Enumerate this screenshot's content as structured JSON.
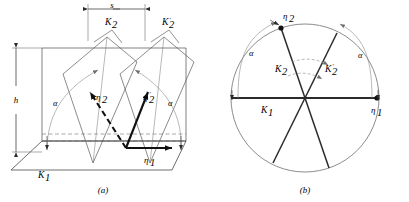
{
  "figure": {
    "type": "geometric-diagram",
    "background_color": "#ffffff",
    "line_color": "#2b2b2b",
    "thin_line_color": "#6e6e6e",
    "bold_line_color": "#111111"
  },
  "panel_a": {
    "caption": "(a)",
    "dimension_labels": {
      "shear_distance": "s",
      "height": "h"
    },
    "plane_labels": [
      {
        "id": "k2",
        "text": "K",
        "subscript": "2",
        "prime": ""
      },
      {
        "id": "k2prime",
        "text": "K",
        "subscript": "2",
        "prime": "′"
      },
      {
        "id": "k1",
        "text": "K",
        "subscript": "1",
        "prime": ""
      }
    ],
    "vector_labels": [
      {
        "id": "eta2",
        "text": "η",
        "subscript": "2",
        "prime": ""
      },
      {
        "id": "eta2prime",
        "text": "η",
        "subscript": "2",
        "prime": "′"
      },
      {
        "id": "eta1",
        "text": "η",
        "subscript": "1",
        "prime": ""
      }
    ],
    "angle_labels": [
      {
        "id": "alpha-left",
        "text": "α"
      },
      {
        "id": "alpha-right",
        "text": "α"
      }
    ]
  },
  "panel_b": {
    "caption": "(b)",
    "circle": {
      "cx": 305,
      "cy": 98,
      "r": 74
    },
    "plane_labels": [
      {
        "id": "k2",
        "text": "K",
        "subscript": "2",
        "prime": ""
      },
      {
        "id": "k2prime",
        "text": "K",
        "subscript": "2",
        "prime": "′"
      },
      {
        "id": "k1",
        "text": "K",
        "subscript": "1",
        "prime": ""
      }
    ],
    "vector_labels": [
      {
        "id": "eta2",
        "text": "η",
        "subscript": "2",
        "prime": ""
      },
      {
        "id": "eta1",
        "text": "η",
        "subscript": "1",
        "prime": ""
      }
    ],
    "angle_labels": [
      {
        "id": "alpha-left",
        "text": "α"
      },
      {
        "id": "alpha-right",
        "text": "α"
      }
    ],
    "marker_points": [
      {
        "id": "eta2-point",
        "angle_deg": 109
      },
      {
        "id": "eta1-point",
        "angle_deg": 0
      }
    ]
  }
}
